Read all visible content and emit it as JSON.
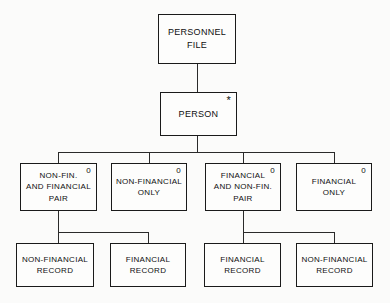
{
  "diagram": {
    "type": "hierarchy-tree",
    "line_color": "#1a1a1a",
    "box_fill": "#fdfdfc",
    "background": "#fbfbfa",
    "levels": [
      {
        "level": 1,
        "nodes": [
          {
            "id": "root",
            "lines": [
              "PERSONNEL",
              "FILE"
            ],
            "marker": ""
          }
        ]
      },
      {
        "level": 2,
        "nodes": [
          {
            "id": "person",
            "lines": [
              "PERSON"
            ],
            "marker": "*"
          }
        ]
      },
      {
        "level": 3,
        "nodes": [
          {
            "id": "l3-1",
            "lines": [
              "NON-FIN.",
              "AND  FINANCIAL",
              "PAIR"
            ],
            "marker": "0"
          },
          {
            "id": "l3-2",
            "lines": [
              "NON-FINANCIAL",
              "ONLY"
            ],
            "marker": "0"
          },
          {
            "id": "l3-3",
            "lines": [
              "FINANCIAL",
              "AND  NON-FIN.",
              "PAIR"
            ],
            "marker": "0"
          },
          {
            "id": "l3-4",
            "lines": [
              "FINANCIAL",
              "ONLY"
            ],
            "marker": "0"
          }
        ]
      },
      {
        "level": 4,
        "nodes": [
          {
            "id": "l4-1",
            "lines": [
              "NON-FINANCIAL",
              "RECORD"
            ],
            "marker": ""
          },
          {
            "id": "l4-2",
            "lines": [
              "FINANCIAL",
              "RECORD"
            ],
            "marker": ""
          },
          {
            "id": "l4-3",
            "lines": [
              "FINANCIAL",
              "RECORD"
            ],
            "marker": ""
          },
          {
            "id": "l4-4",
            "lines": [
              "NON-FINANCIAL",
              "RECORD"
            ],
            "marker": ""
          }
        ]
      }
    ],
    "nodes_flat": {
      "root": {
        "line1": "PERSONNEL",
        "line2": "FILE",
        "line3": "",
        "marker": ""
      },
      "person": {
        "line1": "PERSON",
        "line2": "",
        "line3": "",
        "marker": "*"
      },
      "l3_1": {
        "line1": "NON-FIN.",
        "line2": "AND  FINANCIAL",
        "line3": "PAIR",
        "marker": "0"
      },
      "l3_2": {
        "line1": "NON-FINANCIAL",
        "line2": "ONLY",
        "line3": "",
        "marker": "0"
      },
      "l3_3": {
        "line1": "FINANCIAL",
        "line2": "AND  NON-FIN.",
        "line3": "PAIR",
        "marker": "0"
      },
      "l3_4": {
        "line1": "FINANCIAL",
        "line2": "ONLY",
        "line3": "",
        "marker": "0"
      },
      "l4_1": {
        "line1": "NON-FINANCIAL",
        "line2": "RECORD",
        "line3": "",
        "marker": ""
      },
      "l4_2": {
        "line1": "FINANCIAL",
        "line2": "RECORD",
        "line3": "",
        "marker": ""
      },
      "l4_3": {
        "line1": "FINANCIAL",
        "line2": "RECORD",
        "line3": "",
        "marker": ""
      },
      "l4_4": {
        "line1": "NON-FINANCIAL",
        "line2": "RECORD",
        "line3": "",
        "marker": ""
      }
    },
    "edges": [
      {
        "from": "root",
        "to": "person"
      },
      {
        "from": "person",
        "to": "l3_1"
      },
      {
        "from": "person",
        "to": "l3_2"
      },
      {
        "from": "person",
        "to": "l3_3"
      },
      {
        "from": "person",
        "to": "l3_4"
      },
      {
        "from": "l3_1",
        "to": "l4_1"
      },
      {
        "from": "l3_1",
        "to": "l4_2"
      },
      {
        "from": "l3_3",
        "to": "l4_3"
      },
      {
        "from": "l3_3",
        "to": "l4_4"
      }
    ]
  }
}
